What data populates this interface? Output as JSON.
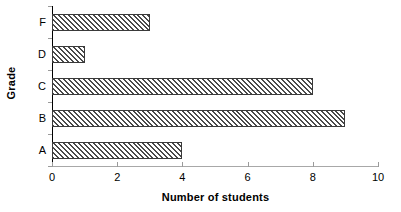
{
  "chart_data": {
    "type": "bar",
    "orientation": "horizontal",
    "title": "",
    "xlabel": "Number of students",
    "ylabel": "Grade",
    "categories": [
      "F",
      "D",
      "C",
      "B",
      "A"
    ],
    "values": [
      3,
      1,
      8,
      9,
      4
    ],
    "series": [
      {
        "name": "Number of students",
        "values": [
          3,
          1,
          8,
          9,
          4
        ]
      }
    ],
    "xlim": [
      0,
      10
    ],
    "x_ticks": [
      0,
      2,
      4,
      6,
      8,
      10
    ],
    "x_tick_labels": [
      "0",
      "2",
      "4",
      "6",
      "8",
      "10"
    ],
    "grid": false,
    "legend": false,
    "legend_position": "none",
    "bar_fill": "diagonal-hatch",
    "bar_border_color": "#3a3a3a",
    "background_color": "#ffffff",
    "axis_color": "#000000"
  },
  "axes": {
    "y_title": "Grade",
    "x_title": "Number of students"
  }
}
